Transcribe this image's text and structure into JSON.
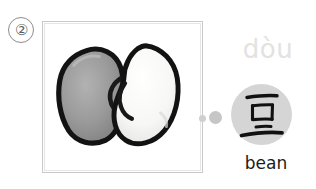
{
  "card": {
    "item_number": "②",
    "pinyin": "dòu",
    "hanzi": "豆",
    "gloss": "bean",
    "illustration_name": "two-beans-photo",
    "beans": [
      {
        "name": "left-bean",
        "fill": "#8f8f8f",
        "outline": "#111111"
      },
      {
        "name": "right-bean",
        "fill": "#fbfbfb",
        "outline": "#111111"
      }
    ],
    "colors": {
      "frame_border": "#c9c9c9",
      "pinyin_text": "#e2e2e2",
      "hanzi_disc": "#d5d5d5",
      "hanzi_ink": "#111111",
      "gloss_text": "#1b1b1b",
      "connector_dot": "#cfcfcf",
      "item_number_ring": "#8d8d8d",
      "background": "#ffffff"
    }
  }
}
